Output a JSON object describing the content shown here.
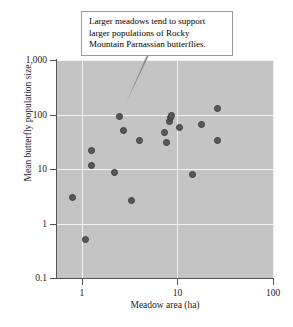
{
  "chart_data": {
    "type": "scatter",
    "title": "",
    "xlabel": "Meadow area (ha)",
    "ylabel": "Mean butterfly population size",
    "xscale": "log",
    "yscale": "log",
    "xlim": [
      0.55,
      100
    ],
    "ylim": [
      0.1,
      1000
    ],
    "grid": true,
    "legend": null,
    "xticks": [
      "1",
      "10",
      "100"
    ],
    "xtick_values": [
      1,
      10,
      100
    ],
    "yticks": [
      "1,000",
      "100",
      "10",
      "1",
      "0.1"
    ],
    "ytick_values": [
      1000,
      100,
      10,
      1,
      0.1
    ],
    "series": [
      {
        "name": "Rocky Mountain Parnassian butterflies",
        "marker": "circle",
        "color": "#595959",
        "points": [
          {
            "x": 0.8,
            "y": 3.0
          },
          {
            "x": 1.1,
            "y": 0.5
          },
          {
            "x": 1.25,
            "y": 22
          },
          {
            "x": 1.25,
            "y": 11.5
          },
          {
            "x": 2.2,
            "y": 8.8
          },
          {
            "x": 2.5,
            "y": 90
          },
          {
            "x": 2.7,
            "y": 50
          },
          {
            "x": 3.3,
            "y": 2.6
          },
          {
            "x": 4.0,
            "y": 34
          },
          {
            "x": 7.3,
            "y": 47
          },
          {
            "x": 7.6,
            "y": 31
          },
          {
            "x": 8.2,
            "y": 75
          },
          {
            "x": 8.4,
            "y": 88
          },
          {
            "x": 8.6,
            "y": 95
          },
          {
            "x": 10.5,
            "y": 57
          },
          {
            "x": 14.5,
            "y": 7.8
          },
          {
            "x": 18.0,
            "y": 65
          },
          {
            "x": 26.0,
            "y": 130
          },
          {
            "x": 26.0,
            "y": 33
          }
        ]
      }
    ],
    "annotations": [
      {
        "name": "callout",
        "lines": [
          "Larger meadows tend to support",
          "larger populations of Rocky",
          "Mountain Parnassian butterflies."
        ],
        "points_to": {
          "x": 2.6,
          "y": 160
        }
      }
    ]
  }
}
